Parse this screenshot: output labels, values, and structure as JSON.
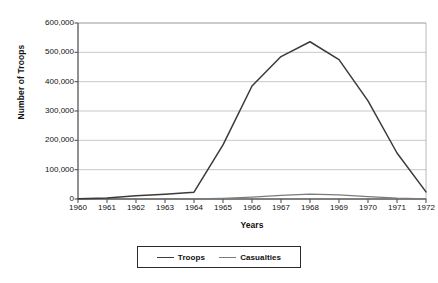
{
  "chart_data": {
    "type": "line",
    "title": "",
    "xlabel": "Years",
    "ylabel": "Number of Troops",
    "x": [
      1960,
      1961,
      1962,
      1963,
      1964,
      1965,
      1966,
      1967,
      1968,
      1969,
      1970,
      1971,
      1972
    ],
    "categories": [
      "1960",
      "1961",
      "1962",
      "1963",
      "1964",
      "1965",
      "1966",
      "1967",
      "1968",
      "1969",
      "1970",
      "1971",
      "1972"
    ],
    "series": [
      {
        "name": "Troops",
        "color": "#3a3a3a",
        "values": [
          900,
          3200,
          11300,
          16300,
          23300,
          184300,
          385300,
          485600,
          536100,
          475200,
          334600,
          156800,
          24200
        ]
      },
      {
        "name": "Casualties",
        "color": "#7a7a7a",
        "values": [
          0,
          200,
          400,
          500,
          600,
          2500,
          6400,
          12100,
          16600,
          13800,
          8200,
          3300,
          900
        ]
      }
    ],
    "ylim": [
      0,
      600000
    ],
    "yticks": [
      0,
      100000,
      200000,
      300000,
      400000,
      500000,
      600000
    ],
    "ytick_labels": [
      "0",
      "100,000",
      "200,000",
      "300,000",
      "400,000",
      "500,000",
      "600,000"
    ],
    "grid": true,
    "grid_axis": "y",
    "legend_position": "bottom-center",
    "legend": [
      "Troops",
      "Casualties"
    ]
  },
  "axes": {
    "x_title": "Years",
    "y_title": "Number of Troops"
  },
  "legend": {
    "entries": [
      {
        "label": "Troops",
        "color": "#3a3a3a"
      },
      {
        "label": "Casualties",
        "color": "#7a7a7a"
      }
    ]
  },
  "colors": {
    "troops_line": "#3a3a3a",
    "casualties_line": "#7a7a7a",
    "grid": "#b9b9b9",
    "axis": "#555555",
    "plot_border": "#a8a8a8",
    "background": "#ffffff"
  },
  "plot_geometry": {
    "left": 78,
    "right": 426,
    "top": 23,
    "bottom": 199
  }
}
